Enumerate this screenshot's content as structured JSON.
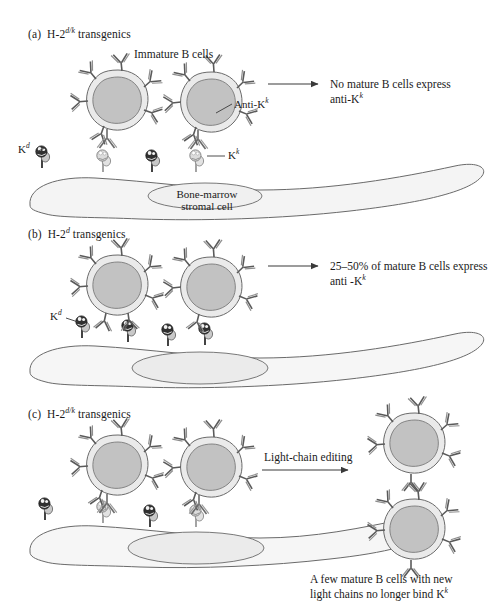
{
  "figure": {
    "type": "immunology-diagram",
    "background_color": "#ffffff",
    "ink_color": "#1a1a1a"
  },
  "colors": {
    "cell_membrane": "#e8e8e8",
    "cell_nucleus": "#bdbdbd",
    "stromal_fill": "#f4f4f4",
    "stromal_nucleus": "#e4e4e4",
    "mhc_kd_dark": "#3a3a3a",
    "mhc_kk_light": "#d8d8d8",
    "outline": "#5a5a5a",
    "text": "#1a1a1a"
  },
  "panels": [
    {
      "id": "a",
      "letter": "(a)",
      "genotype_prefix": "H-2",
      "genotype_sup": "d/k",
      "genotype_suffix": " transgenics",
      "title_plain": "(a) H-2d/k transgenics",
      "labels": {
        "immature": "Immature B cells",
        "anti_kk": "Anti-K",
        "anti_kk_sup": "k",
        "kd": "K",
        "kd_sup": "d",
        "kk": "K",
        "kk_sup": "k",
        "stromal_line1": "Bone-marrow",
        "stromal_line2": "stromal cell"
      },
      "outcome_line1": "No mature B cells express",
      "outcome_line2_prefix": "anti-K",
      "outcome_line2_sup": "k",
      "mhc_on_stroma": [
        "kd",
        "kk",
        "kd",
        "kk"
      ],
      "b_cell_count": 2,
      "arrow": "right"
    },
    {
      "id": "b",
      "letter": "(b)",
      "genotype_prefix": "H-2",
      "genotype_sup": "d",
      "genotype_suffix": " transgenics",
      "title_plain": "(b) H-2d transgenics",
      "labels": {
        "kd": "K",
        "kd_sup": "d"
      },
      "outcome_line1": "25–50% of mature B cells express",
      "outcome_line2_prefix": "anti -K",
      "outcome_line2_sup": "k",
      "mhc_on_stroma": [
        "kd",
        "kd",
        "kd",
        "kd"
      ],
      "b_cell_count": 2,
      "arrow": "right"
    },
    {
      "id": "c",
      "letter": "(c)",
      "genotype_prefix": "H-2",
      "genotype_sup": "d/k",
      "genotype_suffix": " transgenics",
      "title_plain": "(c) H-2d/k transgenics",
      "process_label": "Light-chain editing",
      "mhc_on_stroma": [
        "kd",
        "kk",
        "kd",
        "kk"
      ],
      "b_cell_count": 2,
      "mature_cell_count": 2,
      "arrow": "right",
      "caption_line1": "A few mature B cells with new",
      "caption_line2_prefix": "light chains no longer bind K",
      "caption_line2_sup": "k"
    }
  ]
}
